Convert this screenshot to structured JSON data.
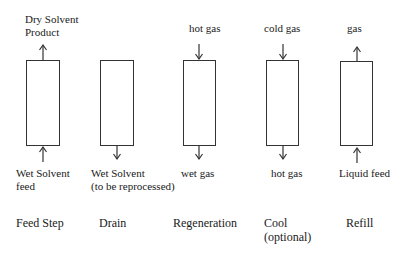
{
  "diagram": {
    "steps": [
      {
        "name": "Feed Step",
        "name_line2": "",
        "top_label": "Dry Solvent",
        "top_label_line2": "Product",
        "top_arrow": "up",
        "bottom_label": "Wet Solvent",
        "bottom_label_line2": "feed",
        "bottom_arrow": "up"
      },
      {
        "name": "Drain",
        "name_line2": "",
        "top_label": "",
        "top_label_line2": "",
        "top_arrow": "none",
        "bottom_label": "Wet Solvent",
        "bottom_label_line2": "(to be reprocessed)",
        "bottom_arrow": "down"
      },
      {
        "name": "Regeneration",
        "name_line2": "",
        "top_label": "hot gas",
        "top_label_line2": "",
        "top_arrow": "down",
        "bottom_label": "wet gas",
        "bottom_label_line2": "",
        "bottom_arrow": "down"
      },
      {
        "name": "Cool",
        "name_line2": "(optional)",
        "top_label": "cold gas",
        "top_label_line2": "",
        "top_arrow": "down",
        "bottom_label": "hot gas",
        "bottom_label_line2": "",
        "bottom_arrow": "down"
      },
      {
        "name": "Refill",
        "name_line2": "",
        "top_label": "gas",
        "top_label_line2": "",
        "top_arrow": "up",
        "bottom_label": "Liquid feed",
        "bottom_label_line2": "",
        "bottom_arrow": "up"
      }
    ],
    "colors": {
      "line": "#333333",
      "text": "#1a1a1a",
      "background": "#ffffff"
    }
  }
}
